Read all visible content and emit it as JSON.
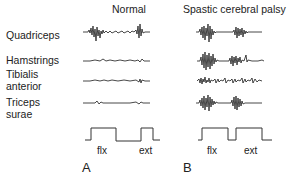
{
  "figure": {
    "columns": {
      "normal": "Normal",
      "spastic": "Spastic cerebral palsy"
    },
    "muscles": [
      {
        "line1": "Quadriceps",
        "line2": ""
      },
      {
        "line1": "Hamstrings",
        "line2": ""
      },
      {
        "line1": "Tibialis",
        "line2": "anterior"
      },
      {
        "line1": "Triceps",
        "line2": "surae"
      }
    ],
    "phase_labels": {
      "A": {
        "flexion": "flx",
        "extension": "ext"
      },
      "B": {
        "flexion": "flx",
        "extension": "ext"
      }
    },
    "panels": {
      "A": "A",
      "B": "B"
    }
  },
  "colors": {
    "trace": "#1a1a1a",
    "step": "#333333",
    "background": "#ffffff"
  }
}
